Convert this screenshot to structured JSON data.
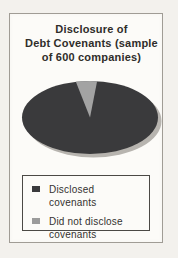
{
  "page": {
    "background": "#f3f1ed",
    "frame_bg": "#fcfbf8",
    "frame_border": "#a09c95"
  },
  "title": {
    "lines": [
      "Disclosure of",
      "Debt Covenants (sample",
      "of 600 companies)"
    ],
    "color": "#2f2d2a"
  },
  "chart_data": {
    "type": "pie",
    "title": "Disclosure of Debt Covenants (sample of 600 companies)",
    "sample_size_label": "sample of 600 companies",
    "style": "3d-ellipse-with-drop-shadow",
    "legend_position": "bottom",
    "series": [
      {
        "label": "Disclosed covenants",
        "pct": 95,
        "color": "#3a3a3c"
      },
      {
        "label": "Did not disclose covenants",
        "pct": 5,
        "color": "#a3a3a3"
      }
    ],
    "gray_slice_start_deg_from_12_oclock": -12,
    "shadow_color": "#b7b4af"
  },
  "legend": {
    "border_color": "#4b4945",
    "text_color": "#343230",
    "items": [
      {
        "label": "Disclosed covenants",
        "swatch_color": "#3a3a3c"
      },
      {
        "label": "Did not disclose covenants",
        "swatch_color": "#9b9b9b"
      }
    ]
  }
}
